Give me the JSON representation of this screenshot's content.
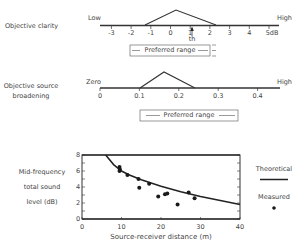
{
  "panel1": {
    "title": "Objective clarity",
    "low_label": "Low",
    "high_label": "High",
    "ticks": [
      "-3",
      "-2",
      "-1",
      "0",
      "1",
      "2",
      "3",
      "4",
      "5dB"
    ],
    "marker_label": "th",
    "range_label": "Preferred range"
  },
  "panel2": {
    "title_line1": "Objective source",
    "title_line2": "broadening",
    "low_label": "Zero",
    "high_label": "High",
    "ticks": [
      "0",
      "0.1",
      "0.2",
      "0.3",
      "0.4"
    ],
    "range_label": "Preferred range"
  },
  "panel3": {
    "ylabel_line1": "Mid-frequency",
    "ylabel_line2": "total sound",
    "ylabel_line3": "level (dB)",
    "xlabel": "Source-receiver distance (m)",
    "yticks": [
      "0",
      "2",
      "4",
      "6",
      "8"
    ],
    "xticks": [
      "0",
      "10",
      "20",
      "30",
      "40"
    ],
    "legend_theoretical": "Theoretical",
    "legend_measured": "Measured"
  },
  "chart_data": [
    {
      "type": "line",
      "title": "Objective clarity",
      "xlabel": "dB",
      "x_range": [
        -3.5,
        5.5
      ],
      "tick_labels": [
        "-3",
        "-2",
        "-1",
        "0",
        "1",
        "2",
        "3",
        "4",
        "5dB"
      ],
      "end_labels": {
        "left": "Low",
        "right": "High"
      },
      "triangle": {
        "x": [
          -1.25,
          0.3,
          2.3
        ],
        "y": [
          0,
          1,
          0
        ]
      },
      "marker": {
        "label": "th",
        "x": 1.1
      },
      "annotation": "Preferred range",
      "preferred_range": [
        -2,
        2
      ]
    },
    {
      "type": "line",
      "title": "Objective source broadening",
      "x_range": [
        0,
        0.45
      ],
      "tick_labels": [
        "0",
        "0.1",
        "0.2",
        "0.3",
        "0.4"
      ],
      "end_labels": {
        "left": "Zero",
        "right": "High"
      },
      "triangle": {
        "x": [
          0.1,
          0.16,
          0.24
        ],
        "y": [
          0,
          1,
          0
        ]
      },
      "annotation": "Preferred range",
      "preferred_range": [
        0.1,
        0.35
      ]
    },
    {
      "type": "scatter",
      "title": "",
      "xlabel": "Source-receiver distance (m)",
      "ylabel": "Mid-frequency total sound level (dB)",
      "xlim": [
        0,
        40
      ],
      "ylim": [
        0,
        8
      ],
      "xticks": [
        0,
        10,
        20,
        30,
        40
      ],
      "yticks": [
        0,
        2,
        4,
        6,
        8
      ],
      "legend": [
        "Theoretical",
        "Measured"
      ],
      "legend_position": "right",
      "series": [
        {
          "name": "Theoretical",
          "type": "line",
          "x": [
            6,
            8,
            10,
            12,
            15,
            20,
            25,
            30,
            35,
            40
          ],
          "y": [
            8.0,
            6.8,
            6.0,
            5.5,
            4.9,
            4.1,
            3.4,
            2.8,
            2.3,
            1.8
          ]
        },
        {
          "name": "Measured",
          "type": "scatter",
          "x": [
            9.5,
            9.6,
            9.5,
            11.5,
            14.3,
            14.5,
            17.0,
            19.3,
            21.0,
            21.6,
            24.2,
            27.0,
            28.5
          ],
          "y": [
            6.5,
            6.2,
            6.0,
            5.5,
            5.0,
            3.9,
            4.4,
            2.8,
            3.1,
            3.2,
            1.8,
            3.3,
            2.6
          ]
        }
      ]
    }
  ]
}
